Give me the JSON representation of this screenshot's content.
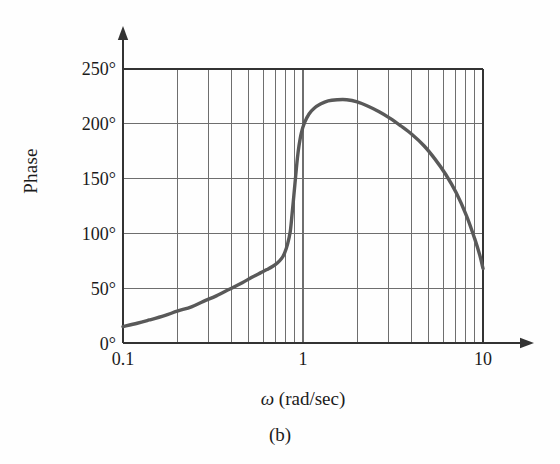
{
  "figure": {
    "caption": "(b)",
    "axis_label_y": "Phase",
    "axis_label_x_symbol": "ω",
    "axis_label_x_units": " (rad/sec)"
  },
  "chart_data": {
    "type": "line",
    "title": "",
    "subtitle": "",
    "xlabel": "ω (rad/sec)",
    "ylabel": "Phase",
    "xscale": "log",
    "yscale": "linear",
    "xlim": [
      0.1,
      10
    ],
    "ylim": [
      0,
      250
    ],
    "grid": true,
    "legend": null,
    "x_tick_labels": [
      "0.1",
      "1",
      "10"
    ],
    "x_tick_values": [
      0.1,
      1,
      10
    ],
    "y_tick_labels": [
      "0°",
      "50°",
      "100°",
      "150°",
      "200°",
      "250°"
    ],
    "y_tick_values": [
      0,
      50,
      100,
      150,
      200,
      250
    ],
    "y_unit": "degrees",
    "series": [
      {
        "name": "Phase",
        "color": "#595959",
        "x": [
          0.1,
          0.12,
          0.14,
          0.17,
          0.2,
          0.24,
          0.28,
          0.33,
          0.39,
          0.46,
          0.52,
          0.58,
          0.63,
          0.68,
          0.72,
          0.76,
          0.79,
          0.82,
          0.85,
          0.87,
          0.89,
          0.91,
          0.93,
          0.95,
          0.98,
          1.02,
          1.08,
          1.15,
          1.25,
          1.38,
          1.55,
          1.75,
          2.0,
          2.3,
          2.65,
          3.05,
          3.5,
          4.05,
          4.7,
          5.4,
          6.2,
          7.1,
          8.1,
          9.0,
          9.6,
          10.0
        ],
        "y": [
          15,
          18,
          21,
          25,
          29,
          33,
          38,
          43,
          49,
          55,
          60,
          64,
          67,
          70,
          73,
          77,
          82,
          90,
          102,
          118,
          135,
          152,
          168,
          180,
          192,
          201,
          209,
          214,
          218,
          221,
          222,
          222,
          220,
          216,
          211,
          205,
          198,
          190,
          180,
          168,
          154,
          137,
          116,
          95,
          80,
          68
        ],
        "peak": {
          "x": 1.65,
          "y": 222
        },
        "start_value": 15,
        "end_value": 68
      }
    ],
    "minor_gridlines": "logarithmic decade subdivisions (2,3,4,5,6,7,8,9 within each decade)"
  },
  "colors": {
    "curve": "#595959",
    "grid": "#6e6e6e",
    "frame": "#333333",
    "text": "#1b1b1b",
    "background": "#fefefe"
  }
}
